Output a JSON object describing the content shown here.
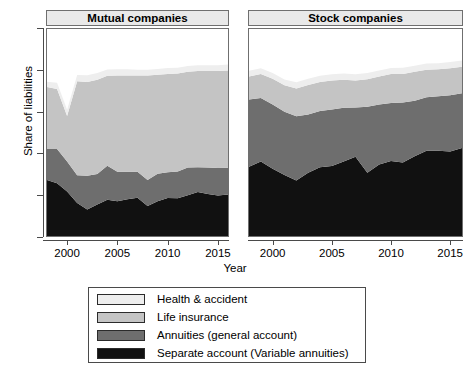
{
  "chart_data": {
    "type": "area",
    "stacked": true,
    "title": "",
    "xlabel": "Year",
    "ylabel": "Share of liabilities",
    "ylim": [
      0,
      1
    ],
    "yticks": [
      "0",
      ".2",
      ".4",
      ".6",
      ".8",
      "1"
    ],
    "ytick_values": [
      0,
      0.2,
      0.4,
      0.6,
      0.8,
      1
    ],
    "xticks": [
      "2000",
      "2005",
      "2010",
      "2015"
    ],
    "xtick_values": [
      2000,
      2005,
      2010,
      2015
    ],
    "xlim": [
      1998,
      2016
    ],
    "grid": false,
    "legend_position": "bottom",
    "series_order_bottom_to_top": [
      "Separate account (Variable annuities)",
      "Annuities (general account)",
      "Life insurance",
      "Health & accident"
    ],
    "panels": [
      {
        "name": "Mutual companies",
        "x": [
          1998,
          1999,
          2000,
          2001,
          2002,
          2003,
          2004,
          2005,
          2006,
          2007,
          2008,
          2009,
          2010,
          2011,
          2012,
          2013,
          2014,
          2015,
          2016
        ],
        "series": [
          {
            "name": "Separate account (Variable annuities)",
            "color": "#111111",
            "values": [
              0.27,
              0.255,
              0.215,
              0.16,
              0.128,
              0.152,
              0.175,
              0.168,
              0.178,
              0.185,
              0.145,
              0.168,
              0.183,
              0.182,
              0.197,
              0.212,
              0.203,
              0.196,
              0.2
            ]
          },
          {
            "name": "Annuities (general account)",
            "color": "#6e6e6e",
            "values": [
              0.15,
              0.165,
              0.145,
              0.133,
              0.163,
              0.148,
              0.164,
              0.142,
              0.132,
              0.125,
              0.125,
              0.133,
              0.125,
              0.129,
              0.134,
              0.12,
              0.128,
              0.133,
              0.13
            ]
          },
          {
            "name": "Life insurance",
            "color": "#c4c4c4",
            "values": [
              0.3,
              0.29,
              0.22,
              0.455,
              0.453,
              0.455,
              0.435,
              0.465,
              0.465,
              0.465,
              0.505,
              0.478,
              0.475,
              0.474,
              0.462,
              0.465,
              0.466,
              0.468,
              0.47
            ]
          },
          {
            "name": "Health & accident",
            "color": "#eeeeee",
            "values": [
              0.025,
              0.03,
              0.03,
              0.03,
              0.032,
              0.032,
              0.03,
              0.03,
              0.03,
              0.028,
              0.028,
              0.028,
              0.028,
              0.028,
              0.028,
              0.028,
              0.028,
              0.028,
              0.028
            ]
          }
        ]
      },
      {
        "name": "Stock companies",
        "x": [
          1998,
          1999,
          2000,
          2001,
          2002,
          2003,
          2004,
          2005,
          2006,
          2007,
          2008,
          2009,
          2010,
          2011,
          2012,
          2013,
          2014,
          2015,
          2016
        ],
        "series": [
          {
            "name": "Separate account (Variable annuities)",
            "color": "#111111",
            "values": [
              0.335,
              0.36,
              0.325,
              0.295,
              0.268,
              0.305,
              0.332,
              0.338,
              0.36,
              0.383,
              0.305,
              0.345,
              0.362,
              0.355,
              0.385,
              0.412,
              0.412,
              0.408,
              0.425
            ]
          },
          {
            "name": "Annuities (general account)",
            "color": "#6e6e6e",
            "values": [
              0.325,
              0.307,
              0.31,
              0.305,
              0.31,
              0.282,
              0.272,
              0.273,
              0.26,
              0.238,
              0.32,
              0.29,
              0.28,
              0.29,
              0.268,
              0.258,
              0.263,
              0.272,
              0.265
            ]
          },
          {
            "name": "Life insurance",
            "color": "#c4c4c4",
            "values": [
              0.11,
              0.115,
              0.125,
              0.128,
              0.135,
              0.143,
              0.14,
              0.14,
              0.135,
              0.13,
              0.132,
              0.135,
              0.14,
              0.138,
              0.14,
              0.133,
              0.13,
              0.13,
              0.128
            ]
          },
          {
            "name": "Health & accident",
            "color": "#eeeeee",
            "values": [
              0.028,
              0.028,
              0.028,
              0.028,
              0.03,
              0.03,
              0.03,
              0.03,
              0.03,
              0.03,
              0.03,
              0.03,
              0.03,
              0.03,
              0.03,
              0.03,
              0.03,
              0.03,
              0.03
            ]
          }
        ]
      }
    ],
    "legend": [
      {
        "label": "Health & accident",
        "color": "#eeeeee"
      },
      {
        "label": "Life insurance",
        "color": "#c4c4c4"
      },
      {
        "label": "Annuities (general account)",
        "color": "#6e6e6e"
      },
      {
        "label": "Separate account (Variable annuities)",
        "color": "#111111"
      }
    ]
  }
}
